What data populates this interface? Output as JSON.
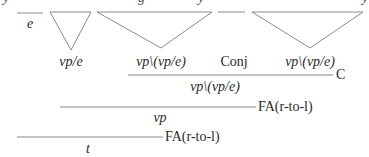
{
  "diagram": {
    "type": "categorial-grammar-derivation",
    "colors": {
      "line": "#8a8a8a",
      "text": "#2a2a2a"
    },
    "top_fragments": [
      {
        "text": "y",
        "x": 3,
        "y": -9
      },
      {
        "text": "g",
        "x": 138,
        "y": -9
      },
      {
        "text": "y",
        "x": 198,
        "y": -9
      },
      {
        "text": "y",
        "x": 362,
        "y": -9
      }
    ],
    "leaves": [
      {
        "kind": "line",
        "x1": 17,
        "x2": 43,
        "y": 13,
        "label": "e",
        "label_x": 30,
        "label_y": 17,
        "italic": true
      },
      {
        "kind": "triangle",
        "x1": 50,
        "x2": 91,
        "y": 12,
        "apex_x": 71,
        "apex_y": 50,
        "label": "vp/e",
        "label_x": 71,
        "label_y": 55,
        "italic": true
      },
      {
        "kind": "triangle",
        "x1": 97,
        "x2": 212,
        "y": 12,
        "apex_x": 161,
        "apex_y": 48,
        "label": "vp\\(vp/e)",
        "label_x": 161,
        "label_y": 55,
        "italic": true
      },
      {
        "kind": "line",
        "x1": 218,
        "x2": 245,
        "y": 12,
        "label": "Conj",
        "label_x": 234,
        "label_y": 55,
        "italic": false
      },
      {
        "kind": "triangle",
        "x1": 252,
        "x2": 363,
        "y": 12,
        "apex_x": 310,
        "apex_y": 48,
        "label": "vp\\(vp/e)",
        "label_x": 310,
        "label_y": 55,
        "italic": true
      }
    ],
    "steps": [
      {
        "x1": 128,
        "x2": 333,
        "y": 75,
        "rule": "C",
        "rule_x": 336,
        "rule_y": 68,
        "result": "vp\\(vp/e)",
        "result_x": 215,
        "result_y": 80
      },
      {
        "x1": 60,
        "x2": 256,
        "y": 107,
        "rule": "FA(r-to-l)",
        "rule_x": 258,
        "rule_y": 100,
        "result": "vp",
        "result_x": 160,
        "result_y": 111
      },
      {
        "x1": 17,
        "x2": 163,
        "y": 137,
        "rule": "FA(r-to-l)",
        "rule_x": 165,
        "rule_y": 130,
        "result": "t",
        "result_x": 88,
        "result_y": 142
      }
    ]
  }
}
